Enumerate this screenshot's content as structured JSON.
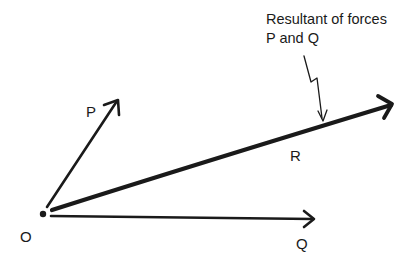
{
  "diagram": {
    "type": "vector-force-diagram",
    "origin": {
      "label": "O"
    },
    "vectors": [
      {
        "id": "P",
        "label": "P"
      },
      {
        "id": "Q",
        "label": "Q"
      },
      {
        "id": "R",
        "label": "R"
      }
    ],
    "annotation": {
      "line1": "Resultant of forces",
      "line2": "P and Q"
    },
    "colors": {
      "ink": "#1a1a1a",
      "background": "#ffffff"
    }
  }
}
